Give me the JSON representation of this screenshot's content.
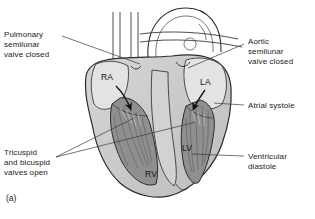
{
  "figure": {
    "caption": "(a)",
    "colors": {
      "background": "#ffffff",
      "myocardium": "#c8c8c8",
      "chamber_fill": "#8f8f8f",
      "vessel_light": "#dcdcdc",
      "outline": "#2b2b2b",
      "leader_line": "#3a3a3a",
      "arrow": "#111111",
      "text": "#1a1a1a"
    }
  },
  "callouts": [
    {
      "id": "pulmonary-valve",
      "text": "Pulmonary\nsemilunar\nvalve closed",
      "side": "left"
    },
    {
      "id": "aortic-valve",
      "text": "Aortic\nsemilunar\nvalve closed",
      "side": "right"
    },
    {
      "id": "atrial-systole",
      "text": "Atrial systole",
      "side": "right"
    },
    {
      "id": "ventricular-diastole",
      "text": "Ventricular\ndiastole",
      "side": "right"
    },
    {
      "id": "av-valves",
      "text": "Tricuspid\nand bicuspid\nvalves open",
      "side": "left"
    }
  ],
  "chambers": [
    {
      "id": "right-atrium",
      "label": "RA"
    },
    {
      "id": "left-atrium",
      "label": "LA"
    },
    {
      "id": "right-ventricle",
      "label": "RV"
    },
    {
      "id": "left-ventricle",
      "label": "LV"
    }
  ],
  "flow_arrows": [
    {
      "id": "ra-to-rv",
      "description": "blood flow from right atrium into right ventricle"
    },
    {
      "id": "la-to-lv",
      "description": "blood flow from left atrium into left ventricle"
    }
  ]
}
